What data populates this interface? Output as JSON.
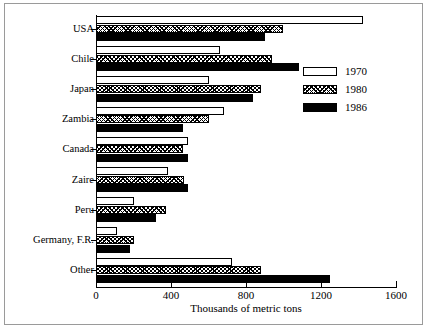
{
  "chart_data": {
    "type": "bar",
    "orientation": "horizontal",
    "title": "",
    "xlabel": "Thousands of metric tons",
    "ylabel": "",
    "xlim": [
      0,
      1600
    ],
    "xticks": [
      0,
      400,
      800,
      1200,
      1600
    ],
    "xticklabels": [
      "0",
      "400",
      "800",
      "1200",
      "1600"
    ],
    "grid": false,
    "legend_position": "right-top",
    "categories": [
      "USA",
      "Chile",
      "Japan",
      "Zambia",
      "Canada",
      "Zaire",
      "Peru",
      "Germany, F.R.",
      "Other"
    ],
    "series": [
      {
        "name": "1970",
        "fill": "white",
        "values": [
          1425,
          660,
          600,
          685,
          490,
          385,
          205,
          110,
          725
        ]
      },
      {
        "name": "1980",
        "fill": "hatched",
        "values": [
          995,
          940,
          880,
          600,
          465,
          470,
          375,
          200,
          880
        ]
      },
      {
        "name": "1986",
        "fill": "black",
        "values": [
          900,
          1080,
          835,
          465,
          490,
          490,
          320,
          180,
          1250
        ]
      }
    ],
    "legend": [
      {
        "label": "1970",
        "swatch": "white"
      },
      {
        "label": "1980",
        "swatch": "hatched"
      },
      {
        "label": "1986",
        "swatch": "black"
      }
    ]
  }
}
